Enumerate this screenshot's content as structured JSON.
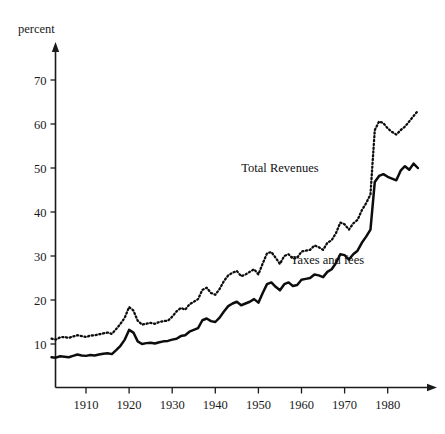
{
  "chart_data": {
    "type": "line",
    "title": "",
    "subtitle": "",
    "xlabel": "",
    "ylabel": "percent",
    "ylabel_position": "top-left",
    "xlim": [
      1902,
      1987
    ],
    "ylim": [
      0,
      75
    ],
    "grid": false,
    "legend": "inline-annotations",
    "y_ticks": [
      10,
      20,
      30,
      40,
      50,
      60,
      70
    ],
    "y_tick_labels": [
      "10",
      "20",
      "30",
      "40",
      "50",
      "60",
      "70"
    ],
    "x_ticks": [
      1910,
      1920,
      1930,
      1940,
      1950,
      1960,
      1970,
      1980
    ],
    "x_tick_labels": [
      "1910",
      "1920",
      "1930",
      "1940",
      "1950",
      "1960",
      "1970",
      "1980"
    ],
    "annotations": [
      {
        "text": "Total Revenues",
        "x": 1955,
        "y": 50,
        "series": "total_revenues"
      },
      {
        "text": "Taxes and fees",
        "x": 1966,
        "y": 29,
        "series": "taxes_and_fees"
      }
    ],
    "x": [
      1902,
      1903,
      1904,
      1905,
      1906,
      1907,
      1908,
      1909,
      1910,
      1911,
      1912,
      1913,
      1914,
      1915,
      1916,
      1917,
      1918,
      1919,
      1920,
      1921,
      1922,
      1923,
      1924,
      1925,
      1926,
      1927,
      1928,
      1929,
      1930,
      1931,
      1932,
      1933,
      1934,
      1935,
      1936,
      1937,
      1938,
      1939,
      1940,
      1941,
      1942,
      1943,
      1944,
      1945,
      1946,
      1947,
      1948,
      1949,
      1950,
      1951,
      1952,
      1953,
      1954,
      1955,
      1956,
      1957,
      1958,
      1959,
      1960,
      1961,
      1962,
      1963,
      1964,
      1965,
      1966,
      1967,
      1968,
      1969,
      1970,
      1971,
      1972,
      1973,
      1974,
      1975,
      1976,
      1977,
      1978,
      1979,
      1980,
      1981,
      1982,
      1983,
      1984,
      1985,
      1986,
      1987
    ],
    "series": [
      {
        "name": "Total Revenues",
        "style": "dotted",
        "values": [
          11.2,
          11.0,
          11.5,
          11.6,
          11.4,
          11.7,
          12.0,
          11.8,
          11.6,
          11.9,
          12.0,
          12.2,
          12.4,
          12.6,
          12.3,
          13.4,
          14.6,
          16.0,
          18.4,
          17.6,
          15.3,
          14.4,
          14.6,
          14.8,
          14.6,
          15.0,
          15.2,
          15.3,
          16.2,
          17.4,
          18.2,
          17.8,
          19.0,
          19.6,
          20.2,
          22.3,
          22.8,
          21.6,
          21.2,
          22.5,
          24.3,
          25.6,
          26.2,
          26.6,
          25.4,
          25.8,
          26.4,
          27.0,
          25.8,
          28.3,
          30.6,
          30.9,
          29.6,
          28.2,
          30.0,
          30.4,
          29.4,
          29.6,
          31.0,
          31.2,
          31.4,
          32.4,
          32.0,
          31.4,
          33.0,
          33.6,
          35.2,
          37.6,
          37.2,
          36.0,
          37.4,
          38.2,
          40.4,
          42.0,
          44.0,
          58.6,
          60.6,
          60.2,
          59.0,
          58.2,
          57.6,
          58.6,
          59.4,
          60.6,
          61.8,
          63.0
        ]
      },
      {
        "name": "Taxes and fees",
        "style": "solid",
        "values": [
          7.0,
          6.9,
          7.2,
          7.1,
          7.0,
          7.3,
          7.6,
          7.4,
          7.3,
          7.5,
          7.4,
          7.6,
          7.8,
          7.9,
          7.7,
          8.6,
          9.6,
          11.0,
          13.2,
          12.6,
          10.6,
          10.0,
          10.2,
          10.3,
          10.1,
          10.4,
          10.6,
          10.7,
          11.0,
          11.2,
          11.8,
          12.0,
          12.8,
          13.2,
          13.6,
          15.4,
          15.8,
          15.2,
          15.0,
          16.0,
          17.4,
          18.6,
          19.2,
          19.6,
          18.8,
          19.2,
          19.6,
          20.2,
          19.4,
          21.6,
          23.6,
          24.0,
          23.0,
          22.2,
          23.6,
          24.0,
          23.2,
          23.4,
          24.6,
          24.8,
          25.0,
          25.8,
          25.6,
          25.2,
          26.4,
          27.0,
          28.4,
          30.4,
          30.2,
          29.2,
          30.4,
          31.2,
          33.0,
          34.4,
          36.0,
          46.8,
          48.2,
          48.6,
          48.0,
          47.6,
          47.2,
          49.4,
          50.4,
          49.6,
          51.0,
          50.0
        ]
      }
    ]
  }
}
